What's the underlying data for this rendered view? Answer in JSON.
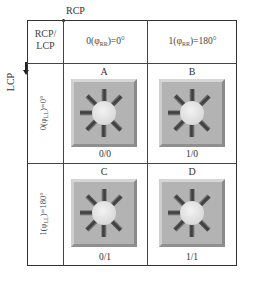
{
  "diagram": {
    "axis_top_label": "RCP",
    "axis_left_label": "LCP",
    "corner_header": [
      "RCP/",
      "LCP"
    ],
    "column_headers": [
      {
        "prefix": "0(",
        "phi": "φ",
        "sub": "RR",
        "suffix": ")=0°"
      },
      {
        "prefix": "1(",
        "phi": "φ",
        "sub": "RR",
        "suffix": ")=180°"
      }
    ],
    "row_headers": [
      {
        "prefix": "0(",
        "phi": "φ",
        "sub": "LL",
        "suffix": ")=0°"
      },
      {
        "prefix": "1(",
        "phi": "φ",
        "sub": "LL",
        "suffix": ")=180°"
      }
    ],
    "cells": [
      {
        "letter": "A",
        "code": "0/0",
        "icon": "sunburst-7-spoke-icon"
      },
      {
        "letter": "B",
        "code": "1/0",
        "icon": "sunburst-7-spoke-icon"
      },
      {
        "letter": "C",
        "code": "0/1",
        "icon": "sunburst-7-spoke-icon"
      },
      {
        "letter": "D",
        "code": "1/1",
        "icon": "sunburst-7-spoke-icon"
      }
    ],
    "colors": {
      "tile_bg": "#b3b3b3",
      "spoke_dark": "#3a3a3a",
      "spoke_light": "#8a8a8a",
      "center_circle": "#e8e8e8",
      "grid_line": "#333333"
    }
  }
}
